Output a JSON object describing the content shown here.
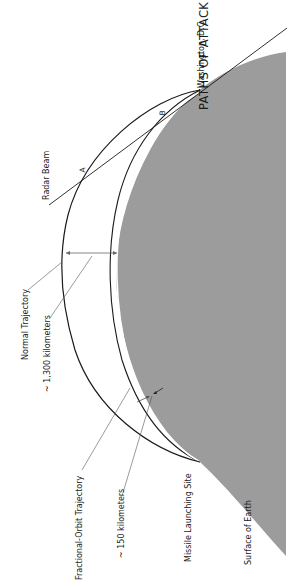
{
  "title": "PATHS OF ATTACK",
  "labels": {
    "washington": "Washington, D.C.",
    "radar_beam": "Radar Beam",
    "normal_trajectory": "Normal Trajectory",
    "normal_altitude": "~ 1,300 kilometers",
    "fractional_orbit": "Fractional-Orbit Trajectory",
    "fractional_altitude": "~ 150 kilometers",
    "launch_site": "Missile Launching Site",
    "earth_surface": "Surface of Earth",
    "point_a": "A",
    "point_b": "B"
  },
  "colors": {
    "earth_fill": "#9c9c9c",
    "line": "#1a1a1a",
    "leader": "#555555",
    "background": "#ffffff"
  }
}
